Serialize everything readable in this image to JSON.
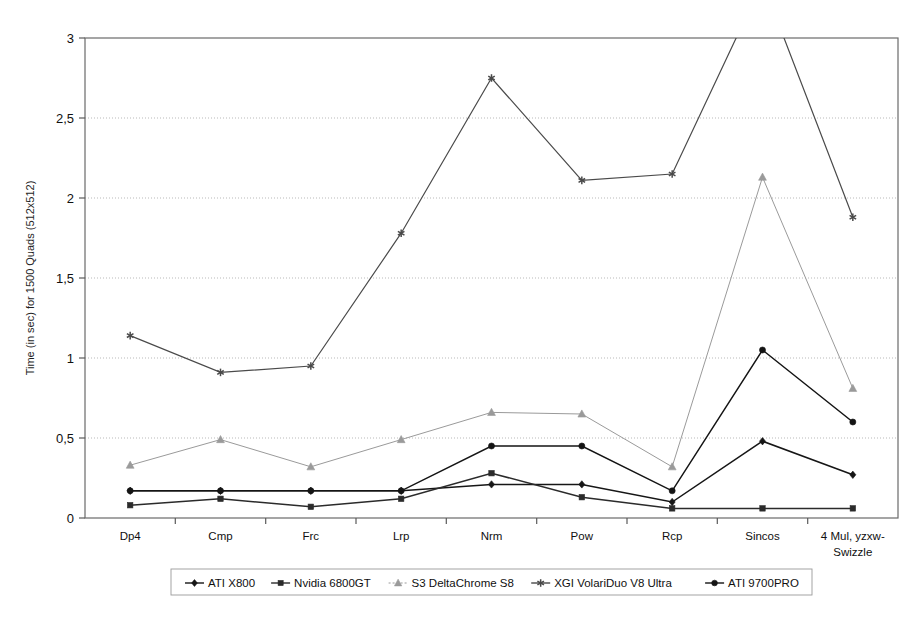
{
  "chart_data": {
    "type": "line",
    "title": "",
    "subtitle": "",
    "xlabel": "",
    "ylabel": "Time (in sec) for 1500 Quads (512x512)",
    "categories": [
      "Dp4",
      "Cmp",
      "Frc",
      "Lrp",
      "Nrm",
      "Pow",
      "Rcp",
      "Sincos",
      "4 Mul, yzxw-Swizzle"
    ],
    "ylim": [
      0,
      3
    ],
    "ytick_labels": [
      "0",
      "0,5",
      "1",
      "1,5",
      "2",
      "2,5",
      "3"
    ],
    "ytick_values": [
      0,
      0.5,
      1,
      1.5,
      2,
      2.5,
      3
    ],
    "grid": true,
    "legend_position": "bottom",
    "clipped_note": "XGI VolariDuo V8 Ultra exceeds the 3 s axis maximum at Sincos (clipped at top border)",
    "series": [
      {
        "name": "ATI X800",
        "marker": "diamond",
        "color": "#161616",
        "values": [
          0.17,
          0.17,
          0.17,
          0.17,
          0.21,
          0.21,
          0.1,
          0.48,
          0.27
        ]
      },
      {
        "name": "Nvidia 6800GT",
        "marker": "square",
        "color": "#2b2b2b",
        "values": [
          0.08,
          0.12,
          0.07,
          0.12,
          0.28,
          0.13,
          0.06,
          0.06,
          0.06
        ]
      },
      {
        "name": "S3 DeltaChrome S8",
        "marker": "triangle",
        "color": "#9a9a9a",
        "values": [
          0.33,
          0.49,
          0.32,
          0.49,
          0.66,
          0.65,
          0.32,
          2.13,
          0.81
        ]
      },
      {
        "name": "XGI VolariDuo V8 Ultra",
        "marker": "asterisk",
        "color": "#4a4a4a",
        "values": [
          1.14,
          0.91,
          0.95,
          1.78,
          2.75,
          2.11,
          2.15,
          3.35,
          1.88
        ]
      },
      {
        "name": "ATI 9700PRO",
        "marker": "circle",
        "color": "#141414",
        "values": [
          0.17,
          0.17,
          0.17,
          0.17,
          0.45,
          0.45,
          0.17,
          1.05,
          0.6
        ]
      }
    ]
  }
}
